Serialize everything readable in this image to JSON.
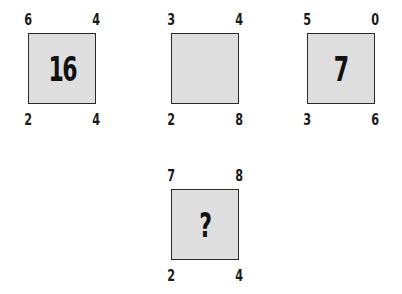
{
  "puzzle": {
    "cells": [
      {
        "id": "cell-1",
        "top_left": "6",
        "top_right": "4",
        "bottom_left": "2",
        "bottom_right": "4",
        "center": "16"
      },
      {
        "id": "cell-2",
        "top_left": "3",
        "top_right": "4",
        "bottom_left": "2",
        "bottom_right": "8",
        "center": ""
      },
      {
        "id": "cell-3",
        "top_left": "5",
        "top_right": "0",
        "bottom_left": "3",
        "bottom_right": "6",
        "center": "7"
      },
      {
        "id": "cell-4",
        "top_left": "7",
        "top_right": "8",
        "bottom_left": "2",
        "bottom_right": "4",
        "center": "?"
      }
    ]
  },
  "colors": {
    "background": "#ffffff",
    "box_fill": "#dedede",
    "box_border": "#2a2a2a",
    "text": "#111111"
  }
}
